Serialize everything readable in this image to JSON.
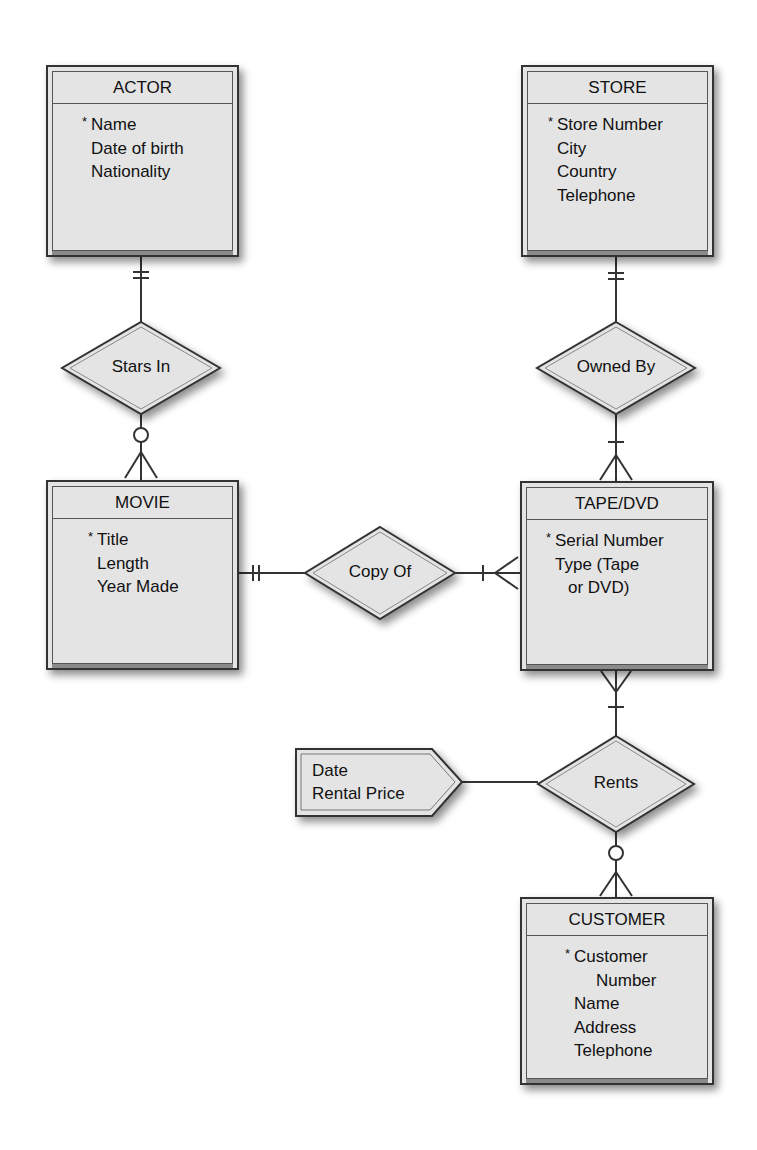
{
  "diagram": {
    "type": "entity-relationship",
    "notation": "crow's foot"
  },
  "entities": {
    "actor": {
      "name": "ACTOR",
      "attributes": [
        {
          "text": "Name",
          "key": true,
          "key_marker": "*"
        },
        {
          "text": "Date of birth",
          "key": false
        },
        {
          "text": "Nationality",
          "key": false
        }
      ]
    },
    "store": {
      "name": "STORE",
      "attributes": [
        {
          "text": "Store Number",
          "key": true,
          "key_marker": "*"
        },
        {
          "text": "City",
          "key": false
        },
        {
          "text": "Country",
          "key": false
        },
        {
          "text": "Telephone",
          "key": false
        }
      ]
    },
    "movie": {
      "name": "MOVIE",
      "attributes": [
        {
          "text": "Title",
          "key": true,
          "key_marker": "*"
        },
        {
          "text": "Length",
          "key": false
        },
        {
          "text": "Year Made",
          "key": false
        }
      ]
    },
    "tape_dvd": {
      "name": "TAPE/DVD",
      "attributes": [
        {
          "text": "Serial Number",
          "key": true,
          "key_marker": "*"
        },
        {
          "text": "Type (Tape",
          "key": false
        },
        {
          "text": "or DVD)",
          "key": false,
          "indent": true
        }
      ]
    },
    "customer": {
      "name": "CUSTOMER",
      "attributes": [
        {
          "text": "Customer",
          "key": true,
          "key_marker": "*"
        },
        {
          "text": "Number",
          "key": false,
          "indent": true
        },
        {
          "text": "Name",
          "key": false
        },
        {
          "text": "Address",
          "key": false
        },
        {
          "text": "Telephone",
          "key": false
        }
      ]
    }
  },
  "relationships": {
    "stars_in": {
      "label": "Stars In",
      "from": "ACTOR",
      "to": "MOVIE",
      "from_cardinality": "exactly one",
      "to_cardinality": "zero or many"
    },
    "owned_by": {
      "label": "Owned By",
      "from": "STORE",
      "to": "TAPE/DVD",
      "from_cardinality": "exactly one",
      "to_cardinality": "one or many"
    },
    "copy_of": {
      "label": "Copy Of",
      "from": "MOVIE",
      "to": "TAPE/DVD",
      "from_cardinality": "exactly one",
      "to_cardinality": "one or many"
    },
    "rents": {
      "label": "Rents",
      "from": "TAPE/DVD",
      "to": "CUSTOMER",
      "from_cardinality": "one or many",
      "to_cardinality": "zero or many"
    }
  },
  "relationship_attributes": {
    "rents": {
      "lines": [
        "Date",
        "Rental Price"
      ]
    }
  },
  "colors": {
    "fill": "#e4e4e4",
    "stroke": "#333333",
    "background": "#ffffff"
  }
}
